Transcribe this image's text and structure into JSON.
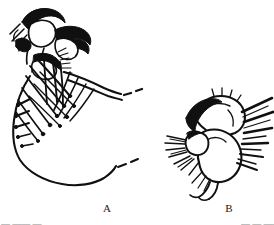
{
  "plate": {
    "background_color": "#ffffff",
    "ink_color": "#101010",
    "width": 274,
    "height": 225,
    "figures": [
      {
        "id": "A",
        "label": "A",
        "description": "Lateral view of head and mouthparts bearing dense setae, with elongate tapering appendage extending to the right ending in a broken (dashed) line"
      },
      {
        "id": "B",
        "label": "B",
        "description": "Detail of leg segment or appendage with radiating stout setae on both margins and terminal claw"
      }
    ]
  },
  "labels": {
    "figure_a": "A",
    "figure_b": "B"
  },
  "caption": {
    "left_fragment": "— —— —",
    "right_fragment": "— — ——"
  }
}
